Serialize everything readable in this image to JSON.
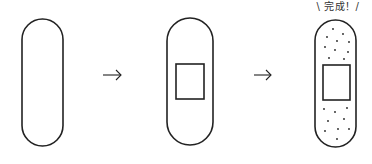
{
  "caption": "\\ 完成！/",
  "steps": [
    {
      "name": "plain-bandage"
    },
    {
      "name": "bandage-with-pad"
    },
    {
      "name": "completed-bandage"
    }
  ],
  "arrow_glyph": "→",
  "colors": {
    "stroke": "#222222",
    "background": "#ffffff"
  }
}
